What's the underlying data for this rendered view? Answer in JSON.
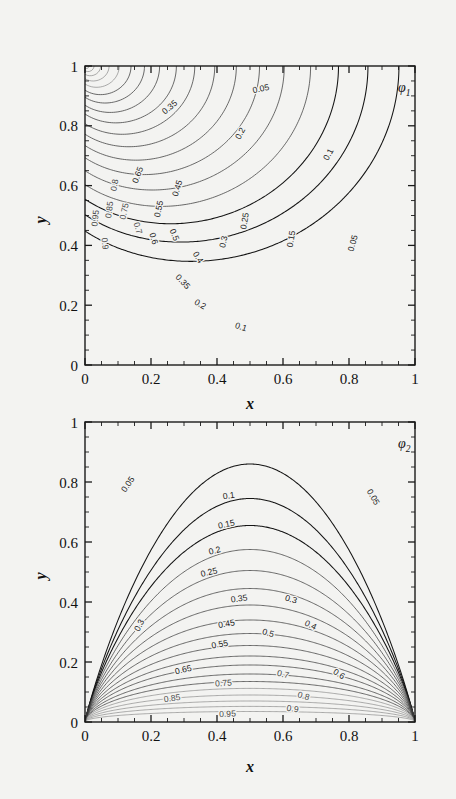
{
  "figure": {
    "background": "#f3f3f1",
    "line_color": "#333333",
    "panels": [
      {
        "id": "phi1",
        "label": "φ",
        "label_sub": "1",
        "xlabel": "x",
        "ylabel": "y",
        "xticks": [
          "0",
          "0.2",
          "0.4",
          "0.6",
          "0.8",
          "1"
        ],
        "yticks": [
          "0",
          "0.2",
          "0.4",
          "0.6",
          "0.8",
          "1"
        ],
        "xlim": [
          0,
          1
        ],
        "ylim": [
          0,
          1
        ],
        "contour_labels": [
          {
            "text": "0.05",
            "x": 0.535,
            "y": 0.915,
            "rot": -12
          },
          {
            "text": "0.05",
            "x": 0.82,
            "y": 0.405,
            "rot": -74
          },
          {
            "text": "0.1",
            "x": 0.745,
            "y": 0.7,
            "rot": -62
          },
          {
            "text": "0.1",
            "x": 0.47,
            "y": 0.118,
            "rot": 18
          },
          {
            "text": "0.15",
            "x": 0.633,
            "y": 0.42,
            "rot": -80
          },
          {
            "text": "0.2",
            "x": 0.478,
            "y": 0.77,
            "rot": -62
          },
          {
            "text": "0.2",
            "x": 0.345,
            "y": 0.195,
            "rot": 30
          },
          {
            "text": "0.25",
            "x": 0.492,
            "y": 0.48,
            "rot": -80
          },
          {
            "text": "0.3",
            "x": 0.428,
            "y": 0.41,
            "rot": -78
          },
          {
            "text": "0.35",
            "x": 0.262,
            "y": 0.855,
            "rot": -40
          },
          {
            "text": "0.35",
            "x": 0.29,
            "y": 0.272,
            "rot": 47
          },
          {
            "text": "0.4",
            "x": 0.335,
            "y": 0.355,
            "rot": 58
          },
          {
            "text": "0.45",
            "x": 0.288,
            "y": 0.588,
            "rot": -72
          },
          {
            "text": "0.5",
            "x": 0.263,
            "y": 0.432,
            "rot": 68
          },
          {
            "text": "0.55",
            "x": 0.232,
            "y": 0.52,
            "rot": -78
          },
          {
            "text": "0.6",
            "x": 0.2,
            "y": 0.42,
            "rot": 72
          },
          {
            "text": "0.65",
            "x": 0.168,
            "y": 0.632,
            "rot": -70
          },
          {
            "text": "0.7",
            "x": 0.152,
            "y": 0.455,
            "rot": 74
          },
          {
            "text": "0.75",
            "x": 0.127,
            "y": 0.512,
            "rot": -78
          },
          {
            "text": "0.8",
            "x": 0.098,
            "y": 0.6,
            "rot": -80
          },
          {
            "text": "0.85",
            "x": 0.082,
            "y": 0.518,
            "rot": -82
          },
          {
            "text": "0.9",
            "x": 0.052,
            "y": 0.405,
            "rot": 84
          },
          {
            "text": "0.95",
            "x": 0.04,
            "y": 0.49,
            "rot": -84
          }
        ]
      },
      {
        "id": "phi2",
        "label": "φ",
        "label_sub": "2",
        "xlabel": "x",
        "ylabel": "y",
        "xticks": [
          "0",
          "0.2",
          "0.4",
          "0.6",
          "0.8",
          "1"
        ],
        "yticks": [
          "0",
          "0.2",
          "0.4",
          "0.6",
          "0.8",
          "1"
        ],
        "xlim": [
          0,
          1
        ],
        "ylim": [
          0,
          1
        ],
        "contour_labels": [
          {
            "text": "0.05",
            "x": 0.137,
            "y": 0.787,
            "rot": -56
          },
          {
            "text": "0.05",
            "x": 0.866,
            "y": 0.745,
            "rot": 60
          },
          {
            "text": "0.1",
            "x": 0.437,
            "y": 0.745,
            "rot": -8
          },
          {
            "text": "0.15",
            "x": 0.43,
            "y": 0.65,
            "rot": -12
          },
          {
            "text": "0.2",
            "x": 0.395,
            "y": 0.562,
            "rot": -14
          },
          {
            "text": "0.25",
            "x": 0.378,
            "y": 0.49,
            "rot": -14
          },
          {
            "text": "0.3",
            "x": 0.622,
            "y": 0.4,
            "rot": 16
          },
          {
            "text": "0.3",
            "x": 0.172,
            "y": 0.318,
            "rot": -62
          },
          {
            "text": "0.35",
            "x": 0.468,
            "y": 0.402,
            "rot": -8
          },
          {
            "text": "0.4",
            "x": 0.68,
            "y": 0.315,
            "rot": 26
          },
          {
            "text": "0.45",
            "x": 0.43,
            "y": 0.318,
            "rot": -10
          },
          {
            "text": "0.5",
            "x": 0.553,
            "y": 0.288,
            "rot": 16
          },
          {
            "text": "0.55",
            "x": 0.41,
            "y": 0.25,
            "rot": -10
          },
          {
            "text": "0.6",
            "x": 0.765,
            "y": 0.152,
            "rot": 32
          },
          {
            "text": "0.65",
            "x": 0.3,
            "y": 0.165,
            "rot": -14
          },
          {
            "text": "0.7",
            "x": 0.598,
            "y": 0.15,
            "rot": 14
          },
          {
            "text": "0.75",
            "x": 0.42,
            "y": 0.12,
            "rot": -4
          },
          {
            "text": "0.8",
            "x": 0.66,
            "y": 0.078,
            "rot": 16
          },
          {
            "text": "0.85",
            "x": 0.265,
            "y": 0.07,
            "rot": -8
          },
          {
            "text": "0.9",
            "x": 0.628,
            "y": 0.035,
            "rot": 8
          },
          {
            "text": "0.95",
            "x": 0.432,
            "y": 0.018,
            "rot": -2
          }
        ]
      }
    ]
  },
  "chart_data": {
    "type": "line",
    "title": "",
    "xlabel": "x",
    "ylabel": "y",
    "xlim": [
      0,
      1
    ],
    "ylim": [
      0,
      1
    ],
    "grid": false,
    "legend": "none",
    "series": [
      {
        "name": "phi1",
        "panel_label": "φ_1",
        "contour_levels": [
          0.05,
          0.1,
          0.15,
          0.2,
          0.25,
          0.3,
          0.35,
          0.4,
          0.45,
          0.5,
          0.55,
          0.6,
          0.65,
          0.7,
          0.75,
          0.8,
          0.85,
          0.9,
          0.95
        ],
        "singularity": [
          0,
          1
        ],
        "note": "contours fan out from the upper-left corner (0,1); low levels bulge toward x=0.87 at mid-height, high levels hug the left edge"
      },
      {
        "name": "phi2",
        "panel_label": "φ_2",
        "contour_levels": [
          0.05,
          0.1,
          0.15,
          0.2,
          0.25,
          0.3,
          0.35,
          0.4,
          0.45,
          0.5,
          0.55,
          0.6,
          0.65,
          0.7,
          0.75,
          0.8,
          0.85,
          0.9,
          0.95
        ],
        "singularities": [
          [
            0,
            0
          ],
          [
            1,
            0
          ]
        ],
        "note": "nested arches spanning between the lower-left (0,0) and lower-right (1,0) corners; level 0.05 peaks near y=0.86, level 0.95 near y=0.04",
        "arch_peak_heights": {
          "0.05": 0.86,
          "0.1": 0.745,
          "0.15": 0.655,
          "0.2": 0.575,
          "0.25": 0.505,
          "0.3": 0.445,
          "0.35": 0.39,
          "0.4": 0.34,
          "0.45": 0.295,
          "0.5": 0.255,
          "0.55": 0.22,
          "0.6": 0.19,
          "0.65": 0.16,
          "0.7": 0.135,
          "0.75": 0.112,
          "0.8": 0.09,
          "0.85": 0.07,
          "0.9": 0.052,
          "0.95": 0.035
        }
      }
    ]
  }
}
